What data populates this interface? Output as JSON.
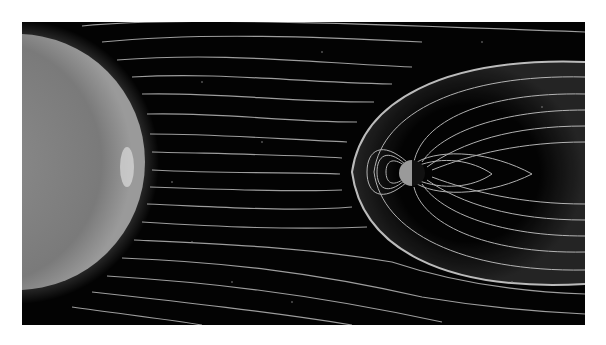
{
  "image": {
    "description": "Illustration of the Sun's solar wind magnetic field lines streaming toward Earth and its magnetosphere",
    "subjects": [
      "sun",
      "solar-wind-field-lines",
      "earth",
      "magnetosphere",
      "bow-shock",
      "stars"
    ],
    "palette": {
      "background": "#030303",
      "sun": "#8a8a8a",
      "lines": "#bdbdbd",
      "earth_day": "#9a9a9a",
      "earth_night": "#111111"
    }
  }
}
